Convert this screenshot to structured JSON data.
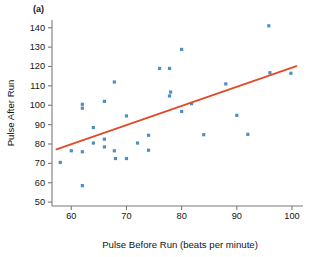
{
  "figure": {
    "panel_label": "(a)"
  },
  "chart_data": {
    "type": "scatter",
    "title": "",
    "subtitle": "",
    "xlabel": "Pulse Before Run (beats per minute)",
    "ylabel": "Pulse After Run",
    "xlim": [
      56.5,
      102.0
    ],
    "ylim": [
      48.0,
      144.0
    ],
    "xticks": [
      60,
      70,
      80,
      90,
      100
    ],
    "yticks": [
      50,
      60,
      70,
      80,
      90,
      100,
      110,
      120,
      130,
      140
    ],
    "xtick_labels": [
      "60",
      "70",
      "80",
      "90",
      "100"
    ],
    "ytick_labels": [
      "50",
      "60",
      "70",
      "80",
      "90",
      "100",
      "110",
      "120",
      "130",
      "140"
    ],
    "grid": false,
    "legend": null,
    "point_color": "#4f8fc0",
    "line_color": "#e0492a",
    "axis_color": "#7b7b7b",
    "x": [
      58.0,
      60.0,
      62.0,
      62.0,
      62.0,
      62.0,
      64.0,
      64.0,
      66.0,
      66.0,
      66.0,
      67.8,
      67.8,
      68.0,
      70.0,
      70.0,
      72.0,
      74.0,
      74.0,
      76.0,
      77.8,
      77.8,
      78.0,
      80.0,
      80.0,
      81.8,
      84.0,
      88.0,
      90.0,
      92.0,
      95.8,
      96.0,
      99.8
    ],
    "y": [
      70.5,
      76.5,
      100.5,
      98.5,
      76.0,
      58.5,
      88.5,
      80.5,
      102.0,
      82.5,
      78.5,
      112.0,
      76.5,
      72.5,
      94.5,
      72.5,
      80.5,
      84.5,
      76.8,
      119.0,
      119.0,
      104.8,
      106.8,
      128.8,
      96.8,
      100.8,
      84.8,
      111.0,
      94.8,
      85.0,
      141.0,
      116.8,
      116.5
    ],
    "points": [
      {
        "x": 58.0,
        "y": 70.5
      },
      {
        "x": 60.0,
        "y": 76.5
      },
      {
        "x": 62.0,
        "y": 100.5
      },
      {
        "x": 62.0,
        "y": 98.5
      },
      {
        "x": 62.0,
        "y": 76.0
      },
      {
        "x": 62.0,
        "y": 58.5
      },
      {
        "x": 64.0,
        "y": 88.5
      },
      {
        "x": 64.0,
        "y": 80.5
      },
      {
        "x": 66.0,
        "y": 102.0
      },
      {
        "x": 66.0,
        "y": 82.5
      },
      {
        "x": 66.0,
        "y": 78.5
      },
      {
        "x": 67.8,
        "y": 112.0
      },
      {
        "x": 67.8,
        "y": 76.5
      },
      {
        "x": 68.0,
        "y": 72.5
      },
      {
        "x": 70.0,
        "y": 94.5
      },
      {
        "x": 70.0,
        "y": 72.5
      },
      {
        "x": 72.0,
        "y": 80.5
      },
      {
        "x": 74.0,
        "y": 84.5
      },
      {
        "x": 74.0,
        "y": 76.8
      },
      {
        "x": 76.0,
        "y": 119.0
      },
      {
        "x": 77.8,
        "y": 119.0
      },
      {
        "x": 77.8,
        "y": 104.8
      },
      {
        "x": 78.0,
        "y": 106.8
      },
      {
        "x": 80.0,
        "y": 128.8
      },
      {
        "x": 80.0,
        "y": 96.8
      },
      {
        "x": 81.8,
        "y": 100.8
      },
      {
        "x": 84.0,
        "y": 84.8
      },
      {
        "x": 88.0,
        "y": 111.0
      },
      {
        "x": 90.0,
        "y": 94.8
      },
      {
        "x": 92.0,
        "y": 85.0
      },
      {
        "x": 95.8,
        "y": 141.0
      },
      {
        "x": 96.0,
        "y": 116.8
      },
      {
        "x": 99.8,
        "y": 116.5
      }
    ],
    "fit_line": {
      "type": "linear-regression",
      "x_start": 57.3,
      "y_start": 77.2,
      "x_end": 100.8,
      "y_end": 120.2
    }
  }
}
